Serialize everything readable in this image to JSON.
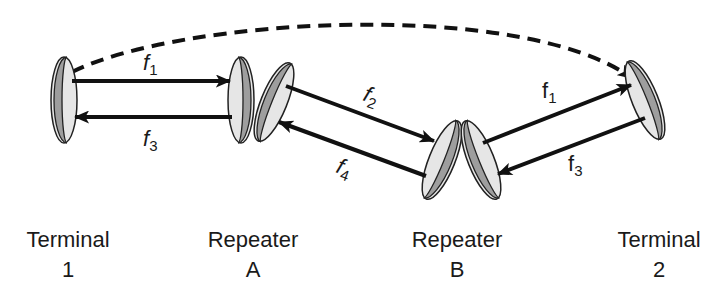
{
  "diagram": {
    "type": "microwave-relay-link",
    "colors": {
      "line": "#111111",
      "dish_dark": "#9e9e9e",
      "dish_light": "#e6e6e6",
      "dish_outline": "#222222",
      "background": "#ffffff"
    },
    "nodes": [
      {
        "id": "terminal-1",
        "label_line1": "Terminal",
        "label_line2": "1"
      },
      {
        "id": "repeater-a",
        "label_line1": "Repeater",
        "label_line2": "A"
      },
      {
        "id": "repeater-b",
        "label_line1": "Repeater",
        "label_line2": "B"
      },
      {
        "id": "terminal-2",
        "label_line1": "Terminal",
        "label_line2": "2"
      }
    ],
    "links": [
      {
        "from": "terminal-1",
        "to": "repeater-a",
        "freq_base": "f",
        "freq_sub": "1"
      },
      {
        "from": "repeater-a",
        "to": "terminal-1",
        "freq_base": "f",
        "freq_sub": "3"
      },
      {
        "from": "repeater-a",
        "to": "repeater-b",
        "freq_base": "f",
        "freq_sub": "2"
      },
      {
        "from": "repeater-b",
        "to": "repeater-a",
        "freq_base": "f",
        "freq_sub": "4"
      },
      {
        "from": "repeater-b",
        "to": "terminal-2",
        "freq_base": "f",
        "freq_sub": "1"
      },
      {
        "from": "terminal-2",
        "to": "repeater-b",
        "freq_base": "f",
        "freq_sub": "3"
      },
      {
        "from": "terminal-1",
        "to": "terminal-2",
        "style": "dashed",
        "freq_base": "",
        "freq_sub": ""
      }
    ]
  }
}
